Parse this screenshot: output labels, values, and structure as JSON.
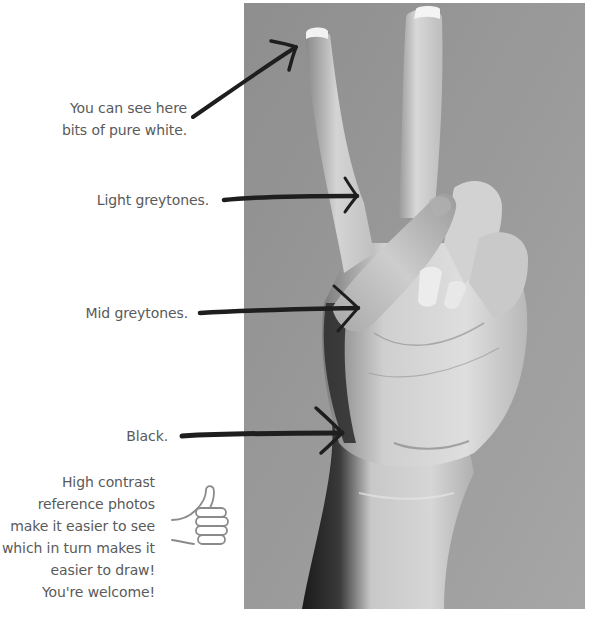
{
  "photo": {
    "subject": "hand making peace sign (grayscale reference photo)",
    "background_color": "#9a9a9a"
  },
  "annotations": [
    {
      "id": "white",
      "text": "You can see here\nbits of pure white."
    },
    {
      "id": "light",
      "text": "Light greytones."
    },
    {
      "id": "mid",
      "text": "Mid greytones."
    },
    {
      "id": "black",
      "text": "Black."
    }
  ],
  "tip": {
    "text": "High contrast\nreference photos\nmake it easier to see\nwhich in turn makes it\neasier to draw!\nYou're welcome!",
    "icon": "thumbs-up-icon"
  },
  "colors": {
    "text": "#5a5a5a",
    "arrow": "#1e1e1e",
    "icon_stroke": "#8a8a8a"
  }
}
